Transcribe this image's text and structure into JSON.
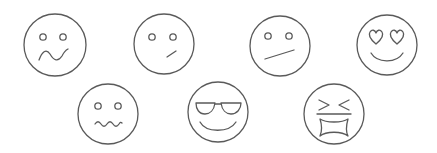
{
  "canvas": {
    "width": 437,
    "height": 153,
    "background": "#ffffff",
    "stroke_color": "#5a5a5a"
  },
  "faces": [
    {
      "id": "worried",
      "label": "worried-face",
      "cx": 55,
      "cy": 45,
      "r": 31
    },
    {
      "id": "skeptical",
      "label": "skeptical-face",
      "cx": 164,
      "cy": 44,
      "r": 30
    },
    {
      "id": "unamused",
      "label": "unamused-face",
      "cx": 280,
      "cy": 46,
      "r": 30
    },
    {
      "id": "heart-eyes",
      "label": "heart-eyes-face",
      "cx": 387,
      "cy": 45,
      "r": 30
    },
    {
      "id": "nervous",
      "label": "nervous-face",
      "cx": 108,
      "cy": 114,
      "r": 30
    },
    {
      "id": "cool-sunglasses",
      "label": "sunglasses-face",
      "cx": 218,
      "cy": 112,
      "r": 30
    },
    {
      "id": "frustrated",
      "label": "frustrated-face",
      "cx": 334,
      "cy": 114,
      "r": 30
    }
  ]
}
